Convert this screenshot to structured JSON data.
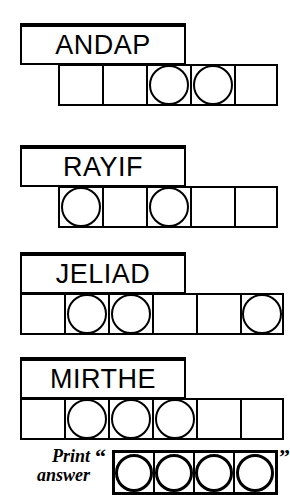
{
  "puzzle": {
    "type": "anagram-letter-grid",
    "rows": [
      {
        "word": "ANDAP",
        "cell_count": 5,
        "circled_positions": [
          3,
          4
        ]
      },
      {
        "word": "RAYIF",
        "cell_count": 5,
        "circled_positions": [
          1,
          3
        ]
      },
      {
        "word": "JELIAD",
        "cell_count": 6,
        "circled_positions": [
          2,
          3,
          6
        ]
      },
      {
        "word": "MIRTHE",
        "cell_count": 6,
        "circled_positions": [
          2,
          3,
          4
        ]
      }
    ],
    "answer": {
      "label_line1": "Print",
      "label_line2": "answer",
      "open_quote": "“",
      "close_quote": "”",
      "cell_count": 4,
      "value": ""
    },
    "colors": {
      "ink": "#000000",
      "paper": "#ffffff"
    }
  }
}
